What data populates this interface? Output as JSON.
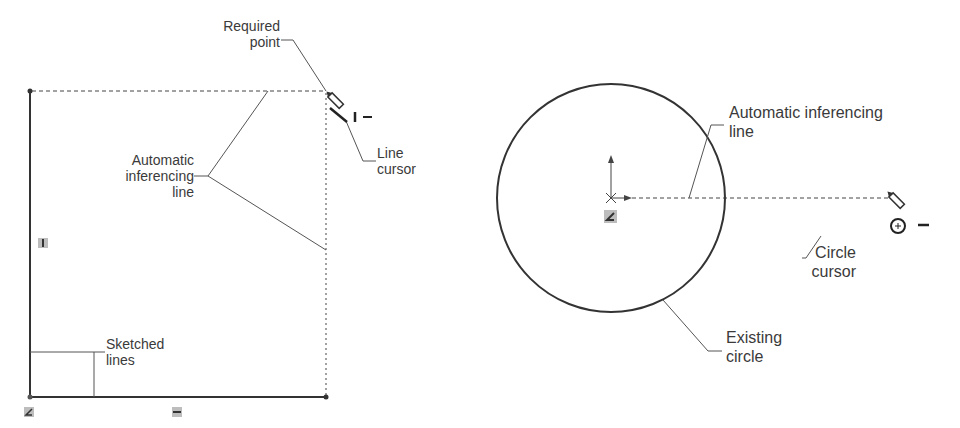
{
  "left_figure": {
    "labels": {
      "required_point": [
        "Required",
        "point"
      ],
      "line_cursor": [
        "Line",
        "cursor"
      ],
      "auto_inferencing": [
        "Automatic",
        "inferencing",
        "line"
      ],
      "sketched_lines": [
        "Sketched",
        "lines"
      ]
    },
    "cursor_suffix": "I –",
    "relation_badges": [
      "vertical",
      "horizontal",
      "coincident-origin"
    ]
  },
  "right_figure": {
    "labels": {
      "auto_inferencing": [
        "Automatic inferencing",
        "line"
      ],
      "circle_cursor": [
        "Circle",
        "cursor"
      ],
      "existing_circle": [
        "Existing",
        "circle"
      ]
    },
    "cursor_suffix": "–"
  },
  "colors": {
    "stroke": "#333333",
    "leader": "#555555",
    "badge": "#bdbdbd",
    "text": "#3a3a3a"
  }
}
